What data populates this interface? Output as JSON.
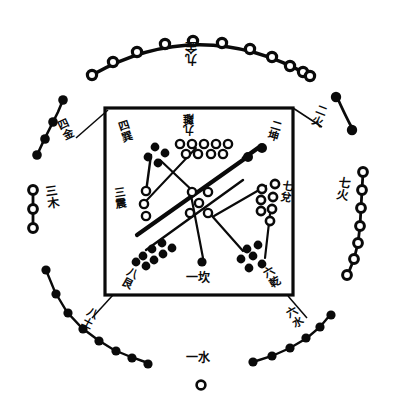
{
  "inner": {
    "center": {
      "label": "五土",
      "count": 5,
      "dot_color": "white"
    },
    "palaces": [
      {
        "key": "north",
        "label": "一坎",
        "number": 1,
        "trigram": "坎",
        "count": 1,
        "dot_color": "black",
        "position": "bottom-center"
      },
      {
        "key": "southwest",
        "label": "二坤",
        "number": 2,
        "trigram": "坤",
        "count": 2,
        "dot_color": "black",
        "position": "top-right"
      },
      {
        "key": "east",
        "label": "三震",
        "number": 3,
        "trigram": "震",
        "count": 3,
        "dot_color": "white",
        "position": "middle-left"
      },
      {
        "key": "southeast",
        "label": "四巽",
        "number": 4,
        "trigram": "巽",
        "count": 4,
        "dot_color": "black",
        "position": "top-left"
      },
      {
        "key": "south",
        "label": "九離",
        "number": 9,
        "trigram": "離",
        "count": 9,
        "dot_color": "white",
        "position": "top-center"
      },
      {
        "key": "northwest",
        "label": "六乾",
        "number": 6,
        "trigram": "乾",
        "count": 6,
        "dot_color": "black",
        "position": "bottom-right"
      },
      {
        "key": "west",
        "label": "七兌",
        "number": 7,
        "trigram": "兌",
        "count": 7,
        "dot_color": "white",
        "position": "middle-right"
      },
      {
        "key": "northeast",
        "label": "八艮",
        "number": 8,
        "trigram": "艮",
        "count": 8,
        "dot_color": "black",
        "position": "bottom-left"
      }
    ]
  },
  "outer": {
    "arcs": [
      {
        "key": "top",
        "label": "九金",
        "number": 9,
        "element": "金",
        "count": 11,
        "dot_color": "white"
      },
      {
        "key": "top-left",
        "label": "四金",
        "number": 4,
        "element": "金",
        "count": 4,
        "dot_color": "black"
      },
      {
        "key": "top-right",
        "label": "二火",
        "number": 2,
        "element": "火",
        "count": 2,
        "dot_color": "black"
      },
      {
        "key": "left",
        "label": "三木",
        "number": 3,
        "element": "木",
        "count": 3,
        "dot_color": "white"
      },
      {
        "key": "right",
        "label": "七火",
        "number": 7,
        "element": "火",
        "count": 7,
        "dot_color": "white"
      },
      {
        "key": "bottom-left",
        "label": "八土",
        "number": 8,
        "element": "土",
        "count": 8,
        "dot_color": "black"
      },
      {
        "key": "bottom-right",
        "label": "六水",
        "number": 6,
        "element": "水",
        "count": 6,
        "dot_color": "black"
      },
      {
        "key": "bottom",
        "label": "一水",
        "number": 1,
        "element": "水",
        "count": 1,
        "dot_color": "white"
      }
    ]
  },
  "colors": {
    "ink": "#0a0a0a",
    "paper": "#ffffff",
    "dot_fill_white": "#ffffff",
    "dot_fill_black": "#0a0a0a"
  }
}
